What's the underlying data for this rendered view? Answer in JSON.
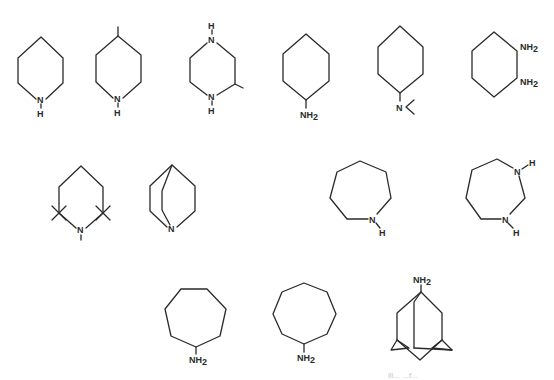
{
  "figure": {
    "type": "chemical-structure-grid",
    "background": "#ffffff",
    "line_color": "#2a2a2a",
    "rows": 3,
    "molecules": [
      {
        "id": "piperidine",
        "name": "Piperidine",
        "labels": {
          "n": "N",
          "h": "H"
        }
      },
      {
        "id": "4-methylpiperidine",
        "name": "4-Methylpiperidine",
        "labels": {
          "n": "N",
          "h": "H"
        }
      },
      {
        "id": "2-methylpiperazine",
        "name": "2-Methylpiperazine",
        "labels": {
          "n1": "N",
          "h1": "H",
          "n2": "N",
          "h2": "H"
        }
      },
      {
        "id": "cyclohexylamine",
        "name": "Cyclohexylamine",
        "labels": {
          "nh": "NH",
          "sub": "2"
        }
      },
      {
        "id": "n-n-dimethylcyclohexylamine",
        "name": "N,N-Dimethylcyclohexylamine",
        "labels": {
          "n": "N"
        }
      },
      {
        "id": "1-2-diaminocyclohexane",
        "name": "1,2-Diaminocyclohexane",
        "labels": {
          "nh_a": "NH",
          "sub_a": "2",
          "nh_b": "NH",
          "sub_b": "2"
        }
      },
      {
        "id": "pentamethylpiperidine",
        "name": "1,2,2,6,6-Pentamethylpiperidine",
        "labels": {
          "n": "N"
        }
      },
      {
        "id": "quinuclidine",
        "name": "Quinuclidine",
        "labels": {
          "n": "N"
        }
      },
      {
        "id": "azepane",
        "name": "Azepane",
        "labels": {
          "n": "N",
          "h": "H"
        }
      },
      {
        "id": "1-3-diazepane",
        "name": "1,3-Diazepane",
        "labels": {
          "n1": "N",
          "h1": "H",
          "n2": "N",
          "h2": "H"
        }
      },
      {
        "id": "cycloheptylamine",
        "name": "Cycloheptylamine",
        "labels": {
          "nh": "NH",
          "sub": "2"
        }
      },
      {
        "id": "cyclooctylamine",
        "name": "Cyclooctylamine",
        "labels": {
          "nh": "NH",
          "sub": "2"
        }
      },
      {
        "id": "1-adamantylamine",
        "name": "1-Adamantylamine",
        "labels": {
          "nh": "NH",
          "sub": "2"
        }
      }
    ],
    "footer_faint_text": "ill... ...f..."
  }
}
